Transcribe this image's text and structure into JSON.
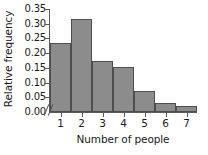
{
  "chart_data": {
    "type": "bar",
    "title": "",
    "xlabel": "Number of people",
    "ylabel": "Relative frequency",
    "categories": [
      "1",
      "2",
      "3",
      "4",
      "5",
      "6",
      "7"
    ],
    "values": [
      0.233,
      0.317,
      0.175,
      0.154,
      0.072,
      0.029,
      0.019
    ],
    "ylim": [
      0.0,
      0.35
    ],
    "ytick_labels": [
      "0.00",
      "0.05",
      "0.10",
      "0.15",
      "0.20",
      "0.25",
      "0.30",
      "0.35"
    ],
    "ytick_values": [
      0.0,
      0.05,
      0.1,
      0.15,
      0.2,
      0.25,
      0.3,
      0.35
    ],
    "grid": false,
    "legend": false,
    "axis_break": "//",
    "bar_color": "#8c8c8c",
    "bar_edge_color": "#4e4e4e",
    "axis_color": "#5a5a5a"
  }
}
